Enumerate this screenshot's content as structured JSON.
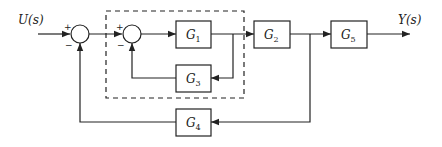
{
  "diagram": {
    "type": "block-diagram",
    "input": {
      "label": "U(s)"
    },
    "output": {
      "label": "Y(s)"
    },
    "summing_junctions": [
      {
        "id": "sum1",
        "signs": {
          "top_left": "+",
          "bottom_left": "−"
        }
      },
      {
        "id": "sum2",
        "signs": {
          "top_left": "+",
          "bottom_left": "−"
        }
      }
    ],
    "blocks": [
      {
        "id": "G1",
        "base": "G",
        "sub": "1"
      },
      {
        "id": "G2",
        "base": "G",
        "sub": "2"
      },
      {
        "id": "G3",
        "base": "G",
        "sub": "3"
      },
      {
        "id": "G4",
        "base": "G",
        "sub": "4"
      },
      {
        "id": "G5",
        "base": "G",
        "sub": "5"
      }
    ],
    "dashed_group": {
      "contains": [
        "sum2",
        "G1",
        "G3"
      ]
    },
    "connections": [
      "U(s) -> sum1(+)",
      "sum1 -> sum2(+)",
      "sum2 -> G1",
      "G1 -> G2",
      "G1 output -> G3 (feedback)",
      "G3 -> sum2(−)",
      "G2 -> G5",
      "G2 output -> G4 (feedback)",
      "G4 -> sum1(−)",
      "G5 -> Y(s)"
    ],
    "colors": {
      "stroke": "#222222",
      "background": "#ffffff"
    }
  }
}
